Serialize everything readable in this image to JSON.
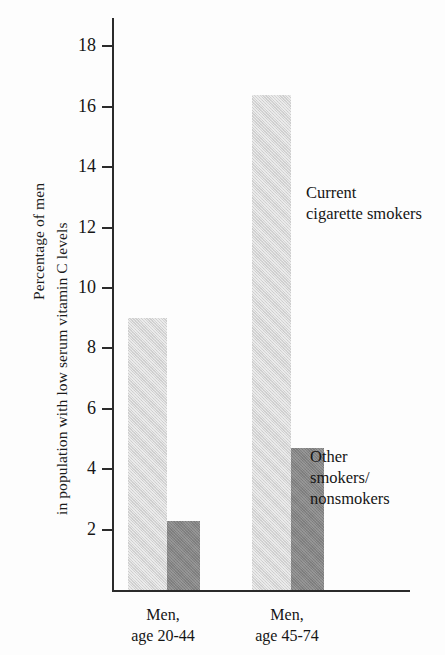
{
  "chart_data": {
    "type": "bar",
    "title": "",
    "subtitle": "",
    "xlabel": "",
    "ylabel": "Percentage of men\nin population with low serum vitamin C levels",
    "ylabel_lines": [
      "Percentage of men",
      "in population with low serum vitamin C levels"
    ],
    "categories": [
      "Men,\nage 20-44",
      "Men,\nage 45-74"
    ],
    "category_lines": [
      [
        "Men,",
        "age 20-44"
      ],
      [
        "Men,",
        "age 45-74"
      ]
    ],
    "series": [
      {
        "name": "Current cigarette smokers",
        "name_lines": [
          "Current",
          "cigarette smokers"
        ],
        "color": "#d5d5d5",
        "values": [
          9.0,
          16.4
        ]
      },
      {
        "name": "Other smokers/nonsmokers",
        "name_lines": [
          "Other",
          "smokers/",
          "nonsmokers"
        ],
        "color": "#848484",
        "values": [
          2.3,
          4.7
        ]
      }
    ],
    "ylim": [
      0,
      19
    ],
    "yticks": [
      2,
      4,
      6,
      8,
      10,
      12,
      14,
      16,
      18
    ],
    "ytick_labels": [
      "2",
      "4",
      "6",
      "8",
      "10",
      "12",
      "14",
      "16",
      "18"
    ],
    "grid": false,
    "legend": "annotations-inline",
    "annotations": [
      {
        "id": "current-cigarette-smokers",
        "text": "Current\ncigarette smokers",
        "refers_to_series": "Current cigarette smokers"
      },
      {
        "id": "other-smokers-nonsmokers",
        "text": "Other\nsmokers/\nnonsmokers",
        "refers_to_series": "Other smokers/nonsmokers"
      }
    ]
  },
  "axis": {
    "line_color": "#2b2b2b"
  }
}
